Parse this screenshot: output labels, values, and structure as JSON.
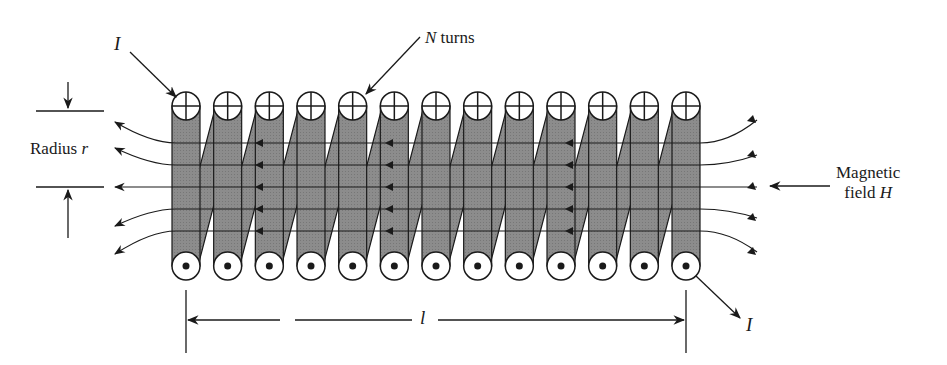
{
  "figure": {
    "type": "solenoid-diagram",
    "turn_count": 13,
    "colors": {
      "coil_fill": "#8a8a8a",
      "ink": "#1a1a1a",
      "background": "#ffffff"
    },
    "labels": {
      "current_in": "I",
      "current_out": "I",
      "n_symbol": "N",
      "n_text": " turns",
      "radius_text": "Radius ",
      "radius_symbol": "r",
      "field_line1": "Magnetic",
      "field_line2_text": "field ",
      "field_symbol": "H",
      "length_symbol": "l"
    }
  }
}
